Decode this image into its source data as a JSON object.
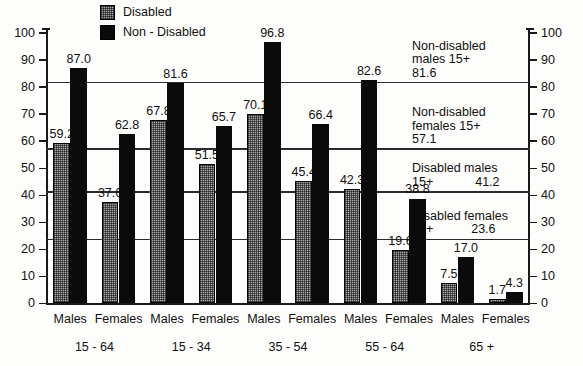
{
  "legend": {
    "items": [
      {
        "label": "Disabled",
        "swatch": "gray-hatched",
        "color": "#a9a9a9"
      },
      {
        "label": "Non - Disabled",
        "swatch": "solid-black",
        "color": "#0b0b0b"
      }
    ]
  },
  "axis": {
    "ticks": [
      0,
      10,
      20,
      30,
      40,
      50,
      60,
      70,
      80,
      90,
      100
    ],
    "ylim": [
      0,
      100
    ]
  },
  "reference_lines": [
    {
      "id": "non-disabled-males",
      "line1": "Non-disabled",
      "line2": "males 15+",
      "value": "81.6",
      "value_num": 81.6
    },
    {
      "id": "non-disabled-females",
      "line1": "Non-disabled",
      "line2": "females 15+",
      "value": "57.1",
      "value_num": 57.1
    },
    {
      "id": "disabled-males",
      "line1": "Disabled males",
      "line2": "15+",
      "value": "41.2",
      "value_num": 41.2
    },
    {
      "id": "disabled-females",
      "line1": "Disabled females",
      "line2": "15+",
      "value": "23.6",
      "value_num": 23.6
    }
  ],
  "groups": [
    {
      "range": "15 - 64",
      "categories": [
        "Males",
        "Females"
      ]
    },
    {
      "range": "15 - 34",
      "categories": [
        "Males",
        "Females"
      ]
    },
    {
      "range": "35 - 54",
      "categories": [
        "Males",
        "Females"
      ]
    },
    {
      "range": "55 - 64",
      "categories": [
        "Males",
        "Females"
      ]
    },
    {
      "range": "65 +",
      "categories": [
        "Males",
        "Females"
      ]
    }
  ],
  "chart_data": {
    "type": "bar",
    "title": "",
    "subtitle": "",
    "xlabel": "",
    "ylabel": "",
    "ylim": [
      0,
      100
    ],
    "grid": false,
    "legend_position": "top-center",
    "categories": [
      "15 - 64 Males",
      "15 - 64 Females",
      "15 - 34 Males",
      "15 - 34 Females",
      "35 - 54 Males",
      "35 - 54 Females",
      "55 - 64 Males",
      "55 - 64 Females",
      "65 + Males",
      "65 + Females"
    ],
    "series": [
      {
        "name": "Disabled",
        "color": "#a9a9a9",
        "values": [
          59.2,
          37.6,
          67.8,
          51.5,
          70.1,
          45.4,
          42.3,
          19.6,
          7.5,
          1.7
        ],
        "labels": [
          "59.2",
          "37.6",
          "67.8",
          "51.5",
          "70.1",
          "45.4",
          "42.3",
          "19.6",
          "7.5",
          "1.7"
        ]
      },
      {
        "name": "Non - Disabled",
        "color": "#0b0b0b",
        "values": [
          87.0,
          62.8,
          81.6,
          65.7,
          96.8,
          66.4,
          82.6,
          38.8,
          17.0,
          4.3
        ],
        "labels": [
          "87.0",
          "62.8",
          "81.6",
          "65.7",
          "96.8",
          "66.4",
          "82.6",
          "38.8",
          "17.0",
          "4.3"
        ]
      }
    ],
    "annotations": [
      {
        "text": "Non-disabled males 15+ 81.6",
        "y": 81.6
      },
      {
        "text": "Non-disabled females 15+ 57.1",
        "y": 57.1
      },
      {
        "text": "Disabled males 15+ 41.2",
        "y": 41.2
      },
      {
        "text": "Disabled females 15+ 23.6",
        "y": 23.6
      }
    ],
    "axis_ticks_left": [
      0,
      10,
      20,
      30,
      40,
      50,
      60,
      70,
      80,
      90,
      100
    ],
    "axis_ticks_right": [
      0,
      10,
      20,
      30,
      40,
      50,
      60,
      70,
      80,
      90,
      100
    ]
  }
}
